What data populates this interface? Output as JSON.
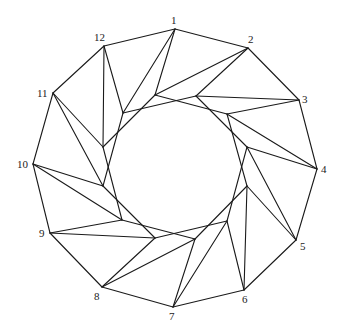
{
  "diagram": {
    "type": "graph",
    "stroke_color": "#1a1a1a",
    "outer_vertices": [
      {
        "label": "1",
        "x": 175,
        "y": 29,
        "lx": 171,
        "ly": 24
      },
      {
        "label": "2",
        "x": 248,
        "y": 48,
        "lx": 248,
        "ly": 43
      },
      {
        "label": "3",
        "x": 299,
        "y": 100,
        "lx": 302,
        "ly": 103
      },
      {
        "label": "4",
        "x": 317,
        "y": 169,
        "lx": 321,
        "ly": 173
      },
      {
        "label": "5",
        "x": 296,
        "y": 240,
        "lx": 300,
        "ly": 250
      },
      {
        "label": "6",
        "x": 244,
        "y": 290,
        "lx": 242,
        "ly": 303
      },
      {
        "label": "7",
        "x": 173,
        "y": 307,
        "lx": 169,
        "ly": 320
      },
      {
        "label": "8",
        "x": 102,
        "y": 287,
        "lx": 94,
        "ly": 300
      },
      {
        "label": "9",
        "x": 50,
        "y": 233,
        "lx": 39,
        "ly": 237
      },
      {
        "label": "10",
        "x": 33,
        "y": 164,
        "lx": 17,
        "ly": 168
      },
      {
        "label": "11",
        "x": 53,
        "y": 93,
        "lx": 37,
        "ly": 97
      },
      {
        "label": "12",
        "x": 104,
        "y": 46,
        "lx": 94,
        "ly": 41
      }
    ],
    "inner_vertices": [
      {
        "x": 155,
        "y": 95
      },
      {
        "x": 196,
        "y": 96
      },
      {
        "x": 227,
        "y": 114
      },
      {
        "x": 247,
        "y": 147
      },
      {
        "x": 247,
        "y": 186
      },
      {
        "x": 227,
        "y": 221
      },
      {
        "x": 195,
        "y": 239
      },
      {
        "x": 155,
        "y": 238
      },
      {
        "x": 122,
        "y": 220
      },
      {
        "x": 103,
        "y": 186
      },
      {
        "x": 103,
        "y": 147
      },
      {
        "x": 123,
        "y": 113
      }
    ]
  }
}
